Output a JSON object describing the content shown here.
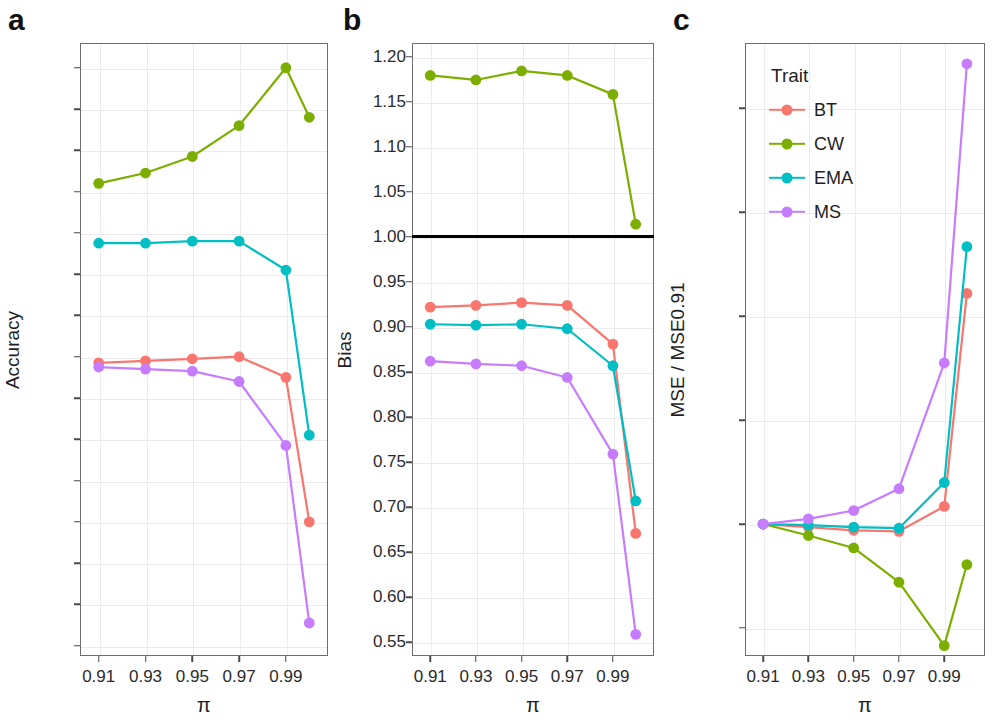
{
  "figure": {
    "panels": [
      {
        "label": "a"
      },
      {
        "label": "b"
      },
      {
        "label": "c"
      }
    ]
  },
  "legend": {
    "title": "Trait",
    "items": [
      {
        "label": "BT",
        "color": "#F8766D"
      },
      {
        "label": "CW",
        "color": "#7CAE00"
      },
      {
        "label": "EMA",
        "color": "#00BFC4"
      },
      {
        "label": "MS",
        "color": "#C77CFF"
      }
    ]
  },
  "colors": {
    "BT": "#F8766D",
    "CW": "#7CAE00",
    "EMA": "#00BFC4",
    "MS": "#C77CFF",
    "reference_line": "#000000",
    "panel_border": "#6e6e6e",
    "grid": "#eceaed"
  },
  "chart_data": [
    {
      "type": "line",
      "panel": "a",
      "title": "",
      "xlabel": "π",
      "ylabel": "Accuracy",
      "x": [
        0.91,
        0.93,
        0.95,
        0.97,
        0.99,
        1.0
      ],
      "xtick_labels": [
        "0.91",
        "0.93",
        "0.95",
        "0.97",
        "0.99"
      ],
      "xtick_values": [
        0.91,
        0.93,
        0.95,
        0.97,
        0.99
      ],
      "xlim": [
        0.902,
        1.008
      ],
      "ylim": [
        0.115,
        0.412
      ],
      "ytick_labels": [
        "0.12",
        "0.14",
        "0.16",
        "0.18",
        "0.20",
        "0.22",
        "0.24",
        "0.26",
        "0.28",
        "0.30",
        "0.32",
        "0.34",
        "0.36",
        "0.38",
        "0.40"
      ],
      "ytick_values": [
        0.12,
        0.14,
        0.16,
        0.18,
        0.2,
        0.22,
        0.24,
        0.26,
        0.28,
        0.3,
        0.32,
        0.34,
        0.36,
        0.38,
        0.4
      ],
      "grid": true,
      "legend_position": "none",
      "series": [
        {
          "name": "BT",
          "color": "#F8766D",
          "values": [
            0.257,
            0.258,
            0.259,
            0.26,
            0.25,
            0.18
          ]
        },
        {
          "name": "CW",
          "color": "#7CAE00",
          "values": [
            0.344,
            0.349,
            0.357,
            0.372,
            0.4,
            0.376
          ]
        },
        {
          "name": "EMA",
          "color": "#00BFC4",
          "values": [
            0.315,
            0.315,
            0.316,
            0.316,
            0.302,
            0.222
          ]
        },
        {
          "name": "MS",
          "color": "#C77CFF",
          "values": [
            0.255,
            0.254,
            0.253,
            0.248,
            0.217,
            0.131
          ]
        }
      ]
    },
    {
      "type": "line",
      "panel": "b",
      "title": "",
      "xlabel": "π",
      "ylabel": "Bias",
      "x": [
        0.91,
        0.93,
        0.95,
        0.97,
        0.99,
        1.0
      ],
      "xtick_labels": [
        "0.91",
        "0.93",
        "0.95",
        "0.97",
        "0.99"
      ],
      "xtick_values": [
        0.91,
        0.93,
        0.95,
        0.97,
        0.99
      ],
      "xlim": [
        0.902,
        1.008
      ],
      "ylim": [
        0.535,
        1.215
      ],
      "ytick_labels": [
        "0.55",
        "0.60",
        "0.65",
        "0.70",
        "0.75",
        "0.80",
        "0.85",
        "0.90",
        "0.95",
        "1.00",
        "1.05",
        "1.10",
        "1.15",
        "1.20"
      ],
      "ytick_values": [
        0.55,
        0.6,
        0.65,
        0.7,
        0.75,
        0.8,
        0.85,
        0.9,
        0.95,
        1.0,
        1.05,
        1.1,
        1.15,
        1.2
      ],
      "grid": true,
      "legend_position": "none",
      "reference_line_y": 1.0,
      "series": [
        {
          "name": "BT",
          "color": "#F8766D",
          "values": [
            0.922,
            0.924,
            0.927,
            0.924,
            0.881,
            0.671
          ]
        },
        {
          "name": "CW",
          "color": "#7CAE00",
          "values": [
            1.179,
            1.174,
            1.184,
            1.179,
            1.158,
            1.014
          ]
        },
        {
          "name": "EMA",
          "color": "#00BFC4",
          "values": [
            0.903,
            0.902,
            0.903,
            0.898,
            0.857,
            0.707
          ]
        },
        {
          "name": "MS",
          "color": "#C77CFF",
          "values": [
            0.862,
            0.859,
            0.857,
            0.844,
            0.759,
            0.559
          ]
        }
      ]
    },
    {
      "type": "line",
      "panel": "c",
      "title": "",
      "xlabel": "π",
      "ylabel": "MSE / MSE0.91",
      "x": [
        0.91,
        0.93,
        0.95,
        0.97,
        0.99,
        1.0
      ],
      "xtick_labels": [
        "0.91",
        "0.93",
        "0.95",
        "0.97",
        "0.99"
      ],
      "xtick_values": [
        0.91,
        0.93,
        0.95,
        0.97,
        0.99
      ],
      "xlim": [
        0.902,
        1.008
      ],
      "ylim": [
        0.9873,
        1.0463
      ],
      "ytick_labels": [
        "0.99",
        "1.00",
        "1.01",
        "1.02",
        "1.03",
        "1.04"
      ],
      "ytick_values": [
        0.99,
        1.0,
        1.01,
        1.02,
        1.03,
        1.04
      ],
      "grid": true,
      "legend_position": "top-left-inside",
      "series": [
        {
          "name": "BT",
          "color": "#F8766D",
          "values": [
            1.0,
            0.9997,
            0.9994,
            0.9993,
            1.0017,
            1.0222
          ]
        },
        {
          "name": "CW",
          "color": "#7CAE00",
          "values": [
            1.0,
            0.9989,
            0.9977,
            0.9944,
            0.9883,
            0.9961
          ]
        },
        {
          "name": "EMA",
          "color": "#00BFC4",
          "values": [
            1.0,
            0.9999,
            0.9997,
            0.9996,
            1.004,
            1.0267
          ]
        },
        {
          "name": "MS",
          "color": "#C77CFF",
          "values": [
            1.0,
            1.0005,
            1.0013,
            1.0034,
            1.0155,
            1.0443
          ]
        }
      ]
    }
  ]
}
